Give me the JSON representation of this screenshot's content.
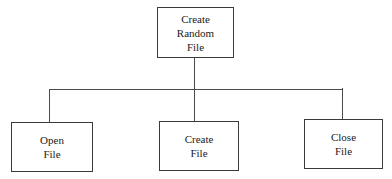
{
  "diagram": {
    "type": "hierarchy-chart",
    "root": {
      "id": "create-random-file",
      "lines": [
        "Create",
        "Random",
        "File"
      ]
    },
    "children": [
      {
        "id": "open-file",
        "lines": [
          "Open",
          "File"
        ]
      },
      {
        "id": "create-file",
        "lines": [
          "Create",
          "File"
        ]
      },
      {
        "id": "close-file",
        "lines": [
          "Close",
          "File"
        ]
      }
    ],
    "colors": {
      "stroke": "#3a3a3a",
      "background": "#ffffff",
      "text": "#1a1a1a"
    }
  }
}
